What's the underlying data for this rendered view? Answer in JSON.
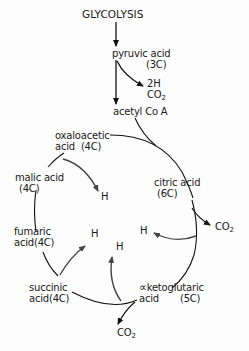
{
  "diagram": {
    "title": "GLYCOLYSIS",
    "pre_cycle": {
      "pyruvic_acid": {
        "name": "pyruvic acid",
        "carbons": "(3C)"
      },
      "byproducts": {
        "hydrogen": "2H",
        "co2": "CO",
        "co2_sub": "2"
      },
      "acetyl_coa": "acetyl Co A"
    },
    "cycle": {
      "oxaloacetic": {
        "line1": "oxaloacetic",
        "line2": "acid",
        "carbons": "(4C)"
      },
      "citric": {
        "name": "citric acid",
        "carbons": "(6C)"
      },
      "alpha_ketoglutaric": {
        "prefix": "∝",
        "line1": "ketoglutaric",
        "line2": "acid",
        "carbons": "(5C)"
      },
      "succinic": {
        "line1": "succinic",
        "line2": "acid",
        "carbons": "(4C)"
      },
      "fumaric": {
        "line1": "fumaric",
        "line2": "acid",
        "carbons": "(4C)"
      },
      "malic": {
        "line1": "malic acid",
        "carbons": "(4C)"
      }
    },
    "outputs": {
      "co2_citric": {
        "text": "CO",
        "sub": "2"
      },
      "co2_ketoglutaric": {
        "text": "CO",
        "sub": "2"
      },
      "h_malic": "H",
      "h_citric": "H",
      "h_fumaric": "H",
      "h_succinic": "H"
    }
  }
}
